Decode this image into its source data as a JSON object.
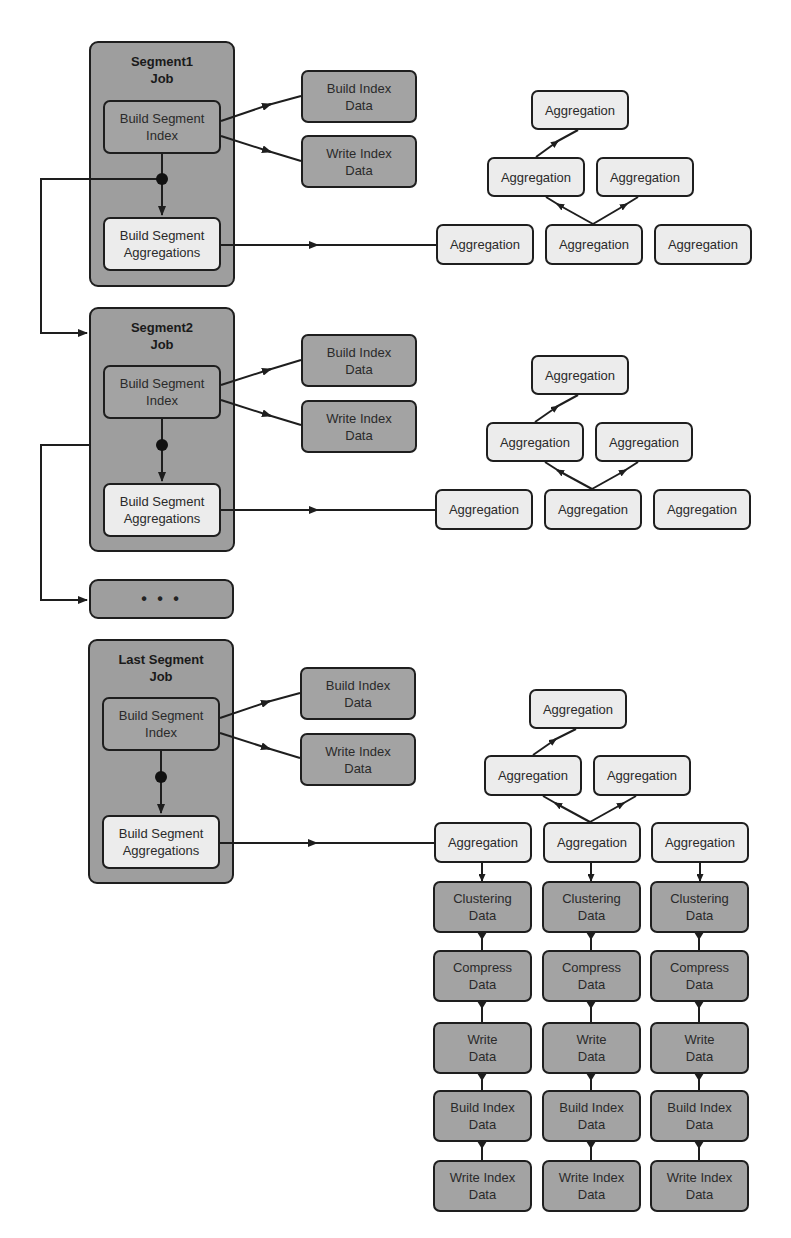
{
  "diagram": {
    "segments": [
      {
        "title_line1": "Segment1",
        "title_line2": "Job",
        "index_task": {
          "line1": "Build Segment",
          "line2": "Index"
        },
        "agg_task": {
          "line1": "Build Segment",
          "line2": "Aggregations"
        },
        "outputs": [
          {
            "line1": "Build Index",
            "line2": "Data"
          },
          {
            "line1": "Write Index",
            "line2": "Data"
          }
        ],
        "aggregation_tree": {
          "top": "Aggregation",
          "middle": [
            "Aggregation",
            "Aggregation"
          ],
          "bottom": [
            "Aggregation",
            "Aggregation",
            "Aggregation"
          ]
        }
      },
      {
        "title_line1": "Segment2",
        "title_line2": "Job",
        "index_task": {
          "line1": "Build Segment",
          "line2": "Index"
        },
        "agg_task": {
          "line1": "Build Segment",
          "line2": "Aggregations"
        },
        "outputs": [
          {
            "line1": "Build Index",
            "line2": "Data"
          },
          {
            "line1": "Write Index",
            "line2": "Data"
          }
        ],
        "aggregation_tree": {
          "top": "Aggregation",
          "middle": [
            "Aggregation",
            "Aggregation"
          ],
          "bottom": [
            "Aggregation",
            "Aggregation",
            "Aggregation"
          ]
        }
      },
      {
        "title_line1": "Last Segment",
        "title_line2": "Job",
        "index_task": {
          "line1": "Build Segment",
          "line2": "Index"
        },
        "agg_task": {
          "line1": "Build Segment",
          "line2": "Aggregations"
        },
        "outputs": [
          {
            "line1": "Build Index",
            "line2": "Data"
          },
          {
            "line1": "Write Index",
            "line2": "Data"
          }
        ],
        "aggregation_tree": {
          "top": "Aggregation",
          "middle": [
            "Aggregation",
            "Aggregation"
          ],
          "bottom": [
            "Aggregation",
            "Aggregation",
            "Aggregation"
          ]
        }
      }
    ],
    "ellipsis_job": "• • •",
    "pipeline_columns": [
      [
        {
          "line1": "Clustering",
          "line2": "Data"
        },
        {
          "line1": "Compress",
          "line2": "Data"
        },
        {
          "line1": "Write",
          "line2": "Data"
        },
        {
          "line1": "Build Index",
          "line2": "Data"
        },
        {
          "line1": "Write Index",
          "line2": "Data"
        }
      ],
      [
        {
          "line1": "Clustering",
          "line2": "Data"
        },
        {
          "line1": "Compress",
          "line2": "Data"
        },
        {
          "line1": "Write",
          "line2": "Data"
        },
        {
          "line1": "Build Index",
          "line2": "Data"
        },
        {
          "line1": "Write Index",
          "line2": "Data"
        }
      ],
      [
        {
          "line1": "Clustering",
          "line2": "Data"
        },
        {
          "line1": "Compress",
          "line2": "Data"
        },
        {
          "line1": "Write",
          "line2": "Data"
        },
        {
          "line1": "Build Index",
          "line2": "Data"
        },
        {
          "line1": "Write Index",
          "line2": "Data"
        }
      ]
    ],
    "colors": {
      "dark_box": "#a3a3a3",
      "light_box": "#ececec",
      "job_container": "#9e9e9e",
      "stroke": "#1e1e1e"
    }
  }
}
